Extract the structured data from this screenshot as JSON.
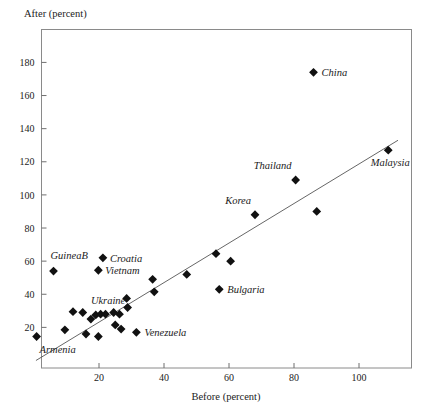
{
  "chart_data": {
    "type": "scatter",
    "title": "",
    "xlabel": "Before (percent)",
    "ylabel": "After (percent)",
    "ylabel_position": "top-left",
    "xlim": [
      0,
      114
    ],
    "ylim": [
      0,
      200
    ],
    "xticks": [
      20,
      40,
      60,
      80,
      100
    ],
    "yticks": [
      20,
      40,
      60,
      80,
      100,
      120,
      140,
      160,
      180
    ],
    "grid": false,
    "legend": false,
    "marker": "diamond",
    "marker_color": "#111111",
    "frame_color": "#8a8a8a",
    "fit_line": {
      "present": true,
      "description": "45-degree style regression line from origin to upper right",
      "x_start": 0.6,
      "y_start": 0.0,
      "x_end": 112.0,
      "y_end": 133.0,
      "color": "#555555"
    },
    "points": [
      {
        "label": "Armenia",
        "x": 0.8,
        "y": 14.5,
        "label_dx": 3,
        "label_dy": 17,
        "anchor": "start"
      },
      {
        "label": "GuineaB",
        "x": 6.0,
        "y": 54.0,
        "label_dx": -3,
        "label_dy": -12,
        "anchor": "start"
      },
      {
        "label": "",
        "x": 9.5,
        "y": 18.5,
        "label_dx": 0,
        "label_dy": 0,
        "anchor": "start"
      },
      {
        "label": "",
        "x": 12.0,
        "y": 29.5,
        "label_dx": 0,
        "label_dy": 0,
        "anchor": "start"
      },
      {
        "label": "",
        "x": 15.0,
        "y": 29.0,
        "label_dx": 0,
        "label_dy": 0,
        "anchor": "start"
      },
      {
        "label": "",
        "x": 16.0,
        "y": 16.0,
        "label_dx": 0,
        "label_dy": 0,
        "anchor": "start"
      },
      {
        "label": "Ukraine",
        "x": 17.5,
        "y": 25.0,
        "label_dx": 0,
        "label_dy": -15,
        "anchor": "start"
      },
      {
        "label": "",
        "x": 19.0,
        "y": 27.5,
        "label_dx": 0,
        "label_dy": 0,
        "anchor": "start"
      },
      {
        "label": "",
        "x": 19.8,
        "y": 14.5,
        "label_dx": 0,
        "label_dy": 0,
        "anchor": "start"
      },
      {
        "label": "Vietnam",
        "x": 19.8,
        "y": 54.5,
        "label_dx": 7,
        "label_dy": 4,
        "anchor": "start"
      },
      {
        "label": "",
        "x": 20.5,
        "y": 28.0,
        "label_dx": 0,
        "label_dy": 0,
        "anchor": "start"
      },
      {
        "label": "Croatia",
        "x": 21.2,
        "y": 62.0,
        "label_dx": 7,
        "label_dy": 4,
        "anchor": "start"
      },
      {
        "label": "",
        "x": 22.0,
        "y": 28.0,
        "label_dx": 0,
        "label_dy": 0,
        "anchor": "start"
      },
      {
        "label": "",
        "x": 24.5,
        "y": 29.0,
        "label_dx": 0,
        "label_dy": 0,
        "anchor": "start"
      },
      {
        "label": "",
        "x": 25.0,
        "y": 21.5,
        "label_dx": 0,
        "label_dy": 0,
        "anchor": "start"
      },
      {
        "label": "",
        "x": 26.3,
        "y": 28.0,
        "label_dx": 0,
        "label_dy": 0,
        "anchor": "start"
      },
      {
        "label": "",
        "x": 26.8,
        "y": 19.0,
        "label_dx": 0,
        "label_dy": 0,
        "anchor": "start"
      },
      {
        "label": "",
        "x": 28.5,
        "y": 37.5,
        "label_dx": 0,
        "label_dy": 0,
        "anchor": "start"
      },
      {
        "label": "",
        "x": 28.8,
        "y": 32.0,
        "label_dx": 0,
        "label_dy": 0,
        "anchor": "start"
      },
      {
        "label": "Venezuela",
        "x": 31.5,
        "y": 17.0,
        "label_dx": 8,
        "label_dy": 4,
        "anchor": "start"
      },
      {
        "label": "",
        "x": 36.5,
        "y": 49.0,
        "label_dx": 0,
        "label_dy": 0,
        "anchor": "start"
      },
      {
        "label": "",
        "x": 37.0,
        "y": 41.5,
        "label_dx": 0,
        "label_dy": 0,
        "anchor": "start"
      },
      {
        "label": "",
        "x": 47.0,
        "y": 52.0,
        "label_dx": 0,
        "label_dy": 0,
        "anchor": "start"
      },
      {
        "label": "",
        "x": 56.0,
        "y": 64.5,
        "label_dx": 0,
        "label_dy": 0,
        "anchor": "start"
      },
      {
        "label": "Bulgaria",
        "x": 57.0,
        "y": 43.0,
        "label_dx": 8,
        "label_dy": 4,
        "anchor": "start"
      },
      {
        "label": "",
        "x": 60.5,
        "y": 60.0,
        "label_dx": 0,
        "label_dy": 0,
        "anchor": "start"
      },
      {
        "label": "Korea",
        "x": 68.0,
        "y": 88.0,
        "label_dx": -4,
        "label_dy": -11,
        "anchor": "end"
      },
      {
        "label": "Thailand",
        "x": 80.5,
        "y": 109.0,
        "label_dx": -4,
        "label_dy": -11,
        "anchor": "end"
      },
      {
        "label": "China",
        "x": 86.0,
        "y": 174.0,
        "label_dx": 8,
        "label_dy": 4,
        "anchor": "start"
      },
      {
        "label": "",
        "x": 87.0,
        "y": 90.0,
        "label_dx": 0,
        "label_dy": 0,
        "anchor": "start"
      },
      {
        "label": "Malaysia",
        "x": 109.0,
        "y": 127.0,
        "label_dx": 2,
        "label_dy": 16,
        "anchor": "middle"
      }
    ]
  },
  "axes": {
    "x_title": "Before (percent)",
    "y_title": "After (percent)"
  }
}
